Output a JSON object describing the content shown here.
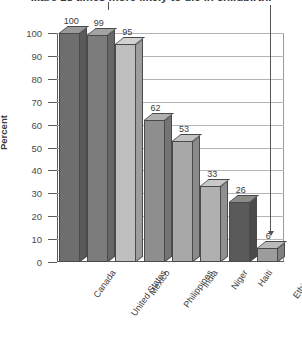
{
  "chart_data": {
    "type": "bar",
    "title": "...are 18 times more likely to die in childbirth.",
    "xlabel": "",
    "ylabel": "Percent",
    "ylim": [
      0,
      100
    ],
    "ytick_step": 10,
    "grid": true,
    "legend": "none",
    "style": "3d-bars-grayscale",
    "categories": [
      "Canada",
      "United States",
      "Mexico",
      "Philippines",
      "India",
      "Niger",
      "Haiti",
      "Ethiopia"
    ],
    "values": [
      100,
      99,
      95,
      62,
      53,
      33,
      26,
      6
    ],
    "bar_colors": [
      "#6e6e6e",
      "#7c7c7c",
      "#bfbfbf",
      "#8e8e8e",
      "#a8a8a8",
      "#b0b0b0",
      "#5a5a5a",
      "#9c9c9c"
    ],
    "ytick_labels": [
      "100",
      "90",
      "80",
      "70",
      "60",
      "50",
      "40",
      "30",
      "20",
      "10",
      "0"
    ],
    "annotation": {
      "name": "pointer-to-ethiopia",
      "target_category": "Ethiopia",
      "target_value": 6
    }
  }
}
